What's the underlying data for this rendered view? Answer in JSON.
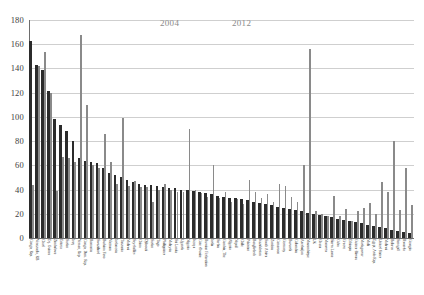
{
  "chart_data": {
    "type": "bar",
    "title": "",
    "subtitle": "",
    "xlabel": "",
    "ylabel": "",
    "ylim": [
      0,
      180
    ],
    "yticks": [
      0,
      20,
      40,
      60,
      80,
      100,
      120,
      140,
      160,
      180
    ],
    "grid": true,
    "legend_position": "top-center",
    "legend": [
      "2004",
      "2012"
    ],
    "colors": {
      "series_2004": "#2b2b2b",
      "series_2012": "#8a8a8a",
      "gridline": "#cfcfcf",
      "axis": "#6d6d6d",
      "legend_text": "#8b8b8b",
      "tick_text": "#3d3d3d",
      "background": "#ffffff"
    },
    "categories": [
      "Congo, Rep.",
      "Venezuela, RB",
      "Chad",
      "Eq. Guinea",
      "Zimbabwe",
      "Eritrea",
      "Sudan",
      "Iraq",
      "Yemen, Rep.",
      "Congo, Dem. Rep.",
      "Romania",
      "Swaziland",
      "Burkina Faso",
      "Vietnam",
      "Indonesia",
      "Tanzania",
      "Malawi",
      "Seychelles",
      "China",
      "Djibouti",
      "Sudan",
      "Togo",
      "Philippines",
      "Malaysia",
      "Sri Lanka",
      "Uganda",
      "Nigeria",
      "Kenya",
      "Cote d'Ivoire",
      "Russian Federation",
      "India",
      "Serbia",
      "Gambia, The",
      "Algeria",
      "Nepal",
      "Chile",
      "Pakistan",
      "Bangladesh",
      "Kazakhstan",
      "South Africa",
      "Zambia",
      "Cameroon",
      "Germany",
      "Burundi",
      "Colombia",
      "Azerbaijan",
      "Mozambique",
      "UK",
      "Ghana",
      "Morocco",
      "Sierra Leone",
      "Cuba",
      "Greece",
      "Ethiopia",
      "Guinea-Bissau",
      "Madagascar",
      "Mali",
      "Egypt, Arab Rep.",
      "United States",
      "Malawi",
      "Belarus",
      "Senegal",
      "Rwanda",
      "Georgia"
    ],
    "series": [
      {
        "name": "2004",
        "color": "#2b2b2b",
        "values": [
          163,
          143,
          139,
          121,
          98,
          93,
          88,
          80,
          66,
          64,
          63,
          62,
          58,
          54,
          52,
          50,
          48,
          46,
          45,
          44,
          44,
          43,
          42,
          41,
          41,
          40,
          40,
          39,
          38,
          37,
          36,
          35,
          34,
          33,
          33,
          32,
          31,
          30,
          29,
          28,
          27,
          26,
          25,
          24,
          23,
          22,
          21,
          20,
          19,
          18,
          17,
          16,
          15,
          14,
          13,
          12,
          11,
          10,
          9,
          8,
          7,
          6,
          5,
          4
        ]
      },
      {
        "name": "2012",
        "color": "#8a8a8a",
        "values": [
          44,
          142,
          154,
          120,
          39,
          67,
          66,
          63,
          168,
          110,
          60,
          58,
          86,
          63,
          45,
          99,
          43,
          47,
          42,
          42,
          30,
          40,
          45,
          40,
          38,
          38,
          90,
          40,
          37,
          34,
          60,
          33,
          38,
          30,
          32,
          28,
          48,
          38,
          33,
          36,
          30,
          45,
          43,
          34,
          30,
          60,
          156,
          22,
          20,
          18,
          35,
          18,
          24,
          14,
          22,
          25,
          29,
          20,
          46,
          38,
          80,
          23,
          58,
          27
        ]
      }
    ]
  },
  "axis": {
    "y_tick_labels": [
      "180",
      "160",
      "140",
      "120",
      "100",
      "80",
      "60",
      "40",
      "20",
      "0"
    ]
  }
}
